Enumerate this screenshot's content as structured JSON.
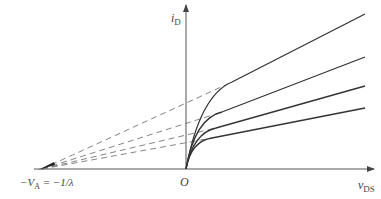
{
  "diagram": {
    "axes": {
      "y_label": {
        "main": "i",
        "sub": "D"
      },
      "x_label": {
        "main": "v",
        "sub": "DS"
      },
      "origin_label": "O",
      "intercept_label": {
        "prefix": "−V",
        "sub": "A",
        "suffix": " = −1/λ"
      }
    },
    "colors": {
      "curve": "#333333",
      "axis": "#555555",
      "dashed": "#777777",
      "text": "#444444"
    },
    "curves": [
      {
        "name": "curve-1",
        "knee_x": 232,
        "knee_y": 82,
        "end_x": 365,
        "end_y": 14
      },
      {
        "name": "curve-2",
        "knee_x": 222,
        "knee_y": 112,
        "end_x": 365,
        "end_y": 57
      },
      {
        "name": "curve-3",
        "knee_x": 216,
        "knee_y": 128,
        "end_x": 365,
        "end_y": 86
      },
      {
        "name": "curve-4",
        "knee_x": 212,
        "knee_y": 138,
        "end_x": 365,
        "end_y": 108
      }
    ]
  }
}
